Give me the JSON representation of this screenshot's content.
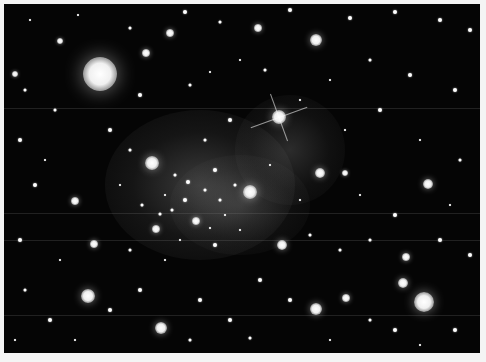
{
  "image": {
    "subject": "galaxy cluster with diffuse glow",
    "background": "#f4f4f4",
    "sky_color": "#050505"
  },
  "nebula": [
    {
      "x": 200,
      "y": 185,
      "rx": 95,
      "ry": 75,
      "opacity": 0.28
    },
    {
      "x": 290,
      "y": 150,
      "rx": 55,
      "ry": 55,
      "opacity": 0.2
    },
    {
      "x": 240,
      "y": 205,
      "rx": 70,
      "ry": 50,
      "opacity": 0.18
    }
  ],
  "bright_stars": [
    {
      "x": 100,
      "y": 74,
      "r": 17
    },
    {
      "x": 279,
      "y": 117,
      "r": 7,
      "spikes": true
    },
    {
      "x": 152,
      "y": 163,
      "r": 7
    },
    {
      "x": 250,
      "y": 192,
      "r": 7
    },
    {
      "x": 424,
      "y": 302,
      "r": 10
    },
    {
      "x": 316,
      "y": 40,
      "r": 6
    },
    {
      "x": 428,
      "y": 184,
      "r": 5
    },
    {
      "x": 282,
      "y": 245,
      "r": 5
    },
    {
      "x": 88,
      "y": 296,
      "r": 7
    },
    {
      "x": 316,
      "y": 309,
      "r": 6
    },
    {
      "x": 161,
      "y": 328,
      "r": 6
    },
    {
      "x": 403,
      "y": 283,
      "r": 5
    },
    {
      "x": 75,
      "y": 201,
      "r": 4
    },
    {
      "x": 94,
      "y": 244,
      "r": 4
    },
    {
      "x": 170,
      "y": 33,
      "r": 4
    },
    {
      "x": 146,
      "y": 53,
      "r": 4
    },
    {
      "x": 258,
      "y": 28,
      "r": 4
    },
    {
      "x": 196,
      "y": 221,
      "r": 4
    },
    {
      "x": 156,
      "y": 229,
      "r": 4
    },
    {
      "x": 346,
      "y": 298,
      "r": 4
    },
    {
      "x": 15,
      "y": 74,
      "r": 3
    },
    {
      "x": 60,
      "y": 41,
      "r": 3
    },
    {
      "x": 320,
      "y": 173,
      "r": 5
    },
    {
      "x": 345,
      "y": 173,
      "r": 3
    },
    {
      "x": 406,
      "y": 257,
      "r": 4
    }
  ],
  "faint_stars": [
    [
      30,
      20
    ],
    [
      78,
      15
    ],
    [
      130,
      28
    ],
    [
      185,
      12
    ],
    [
      220,
      22
    ],
    [
      290,
      10
    ],
    [
      350,
      18
    ],
    [
      395,
      12
    ],
    [
      440,
      20
    ],
    [
      470,
      30
    ],
    [
      25,
      90
    ],
    [
      55,
      110
    ],
    [
      140,
      95
    ],
    [
      190,
      85
    ],
    [
      210,
      72
    ],
    [
      240,
      60
    ],
    [
      265,
      70
    ],
    [
      330,
      80
    ],
    [
      370,
      60
    ],
    [
      410,
      75
    ],
    [
      455,
      90
    ],
    [
      20,
      140
    ],
    [
      45,
      160
    ],
    [
      110,
      130
    ],
    [
      130,
      150
    ],
    [
      205,
      140
    ],
    [
      230,
      120
    ],
    [
      300,
      100
    ],
    [
      345,
      130
    ],
    [
      380,
      110
    ],
    [
      420,
      140
    ],
    [
      460,
      160
    ],
    [
      35,
      185
    ],
    [
      120,
      185
    ],
    [
      175,
      175
    ],
    [
      185,
      200
    ],
    [
      215,
      170
    ],
    [
      270,
      165
    ],
    [
      300,
      200
    ],
    [
      360,
      195
    ],
    [
      395,
      215
    ],
    [
      450,
      205
    ],
    [
      20,
      240
    ],
    [
      60,
      260
    ],
    [
      130,
      250
    ],
    [
      165,
      260
    ],
    [
      180,
      240
    ],
    [
      215,
      245
    ],
    [
      240,
      230
    ],
    [
      310,
      235
    ],
    [
      340,
      250
    ],
    [
      370,
      240
    ],
    [
      440,
      240
    ],
    [
      470,
      255
    ],
    [
      25,
      290
    ],
    [
      50,
      320
    ],
    [
      110,
      310
    ],
    [
      140,
      290
    ],
    [
      200,
      300
    ],
    [
      230,
      320
    ],
    [
      260,
      280
    ],
    [
      290,
      300
    ],
    [
      370,
      320
    ],
    [
      395,
      330
    ],
    [
      455,
      330
    ],
    [
      15,
      340
    ],
    [
      75,
      340
    ],
    [
      190,
      340
    ],
    [
      250,
      338
    ],
    [
      330,
      340
    ],
    [
      420,
      345
    ],
    [
      165,
      195
    ],
    [
      172,
      210
    ],
    [
      205,
      190
    ],
    [
      220,
      200
    ],
    [
      235,
      185
    ],
    [
      188,
      182
    ],
    [
      210,
      228
    ],
    [
      225,
      215
    ],
    [
      142,
      205
    ],
    [
      160,
      214
    ]
  ],
  "streaks": [
    36,
    71,
    80,
    105
  ]
}
